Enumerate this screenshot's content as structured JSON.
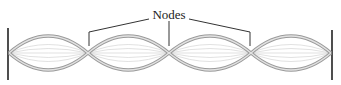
{
  "diagram": {
    "label": "Nodes",
    "node_count": 3,
    "loop_count": 4,
    "colors": {
      "string": "#b0b0b0",
      "string_outline": "#8a8a8a",
      "inner_lines": "#d0d0d0",
      "leader_lines": "#333333",
      "end_posts": "#222222"
    }
  }
}
